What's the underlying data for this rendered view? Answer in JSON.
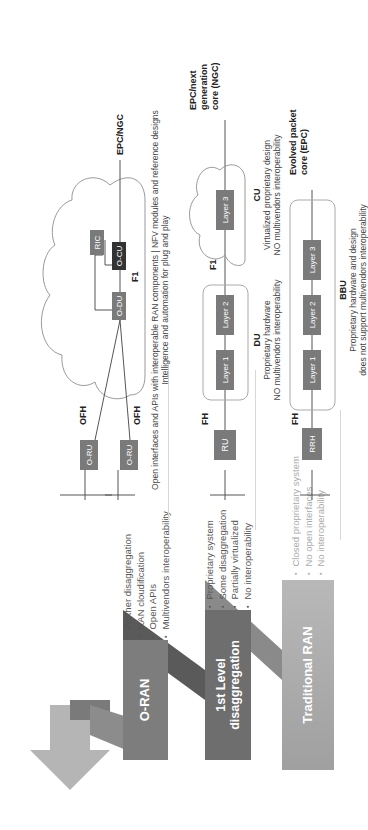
{
  "stairs": [
    {
      "id": "oran",
      "label": "O-RAN",
      "color": "#7d7d7d",
      "bullets": [
        "Further disaggregation",
        "RAN cloudification",
        "Open APIs",
        "Multivendors interoperability"
      ]
    },
    {
      "id": "first",
      "label": "1st Level disaggregation",
      "color": "#6e6e6e",
      "bullets": [
        "Proprietary system",
        "Some disaggregation",
        "Partially virtualized",
        "No interoperability"
      ]
    },
    {
      "id": "trad",
      "label": "Traditional RAN",
      "color": "#a9a9a9",
      "bullets": [
        "Closed proprietary system",
        "No open interfaces",
        "No interoperability"
      ]
    }
  ],
  "oran_diagram": {
    "nodes": {
      "oru1": "O-RU",
      "oru2": "O-RU",
      "odu": "O-DU",
      "ocu": "O-CU",
      "ric": "RIC"
    },
    "labels": {
      "ofh1": "OFH",
      "ofh2": "OFH",
      "f1": "F1",
      "core": "EPC/NGC"
    },
    "caption_line1": "Open interfaces and APIs with interoperable RAN components | NFV modules and reference designs",
    "caption_line2": "Intelligence and automation for plug and play"
  },
  "first_diagram": {
    "nodes": {
      "ru": "RU",
      "l1": "Layer 1",
      "l2": "Layer 2",
      "l3": "Layer 3"
    },
    "labels": {
      "fh": "FH",
      "f1": "F1",
      "core_l1": "EPC/next",
      "core_l2": "generation",
      "core_l3": "core (NGC)"
    },
    "du": {
      "title": "DU",
      "line1": "Proprietary hardware",
      "line2": "NO multivendors interoperability"
    },
    "cu": {
      "title": "CU",
      "line1": "Virtualized proprietary design",
      "line2": "NO multivendors interoperability"
    }
  },
  "trad_diagram": {
    "nodes": {
      "rrh": "RRH",
      "l1": "Layer 1",
      "l2": "Layer 2",
      "l3": "Layer 3"
    },
    "labels": {
      "fh": "FH",
      "core_l1": "Evolved packet",
      "core_l2": "core (EPC)"
    },
    "bbu": {
      "title": "BBU",
      "line1": "Proprietary hardware and design",
      "line2": "does not support multivendors interoperability"
    }
  }
}
